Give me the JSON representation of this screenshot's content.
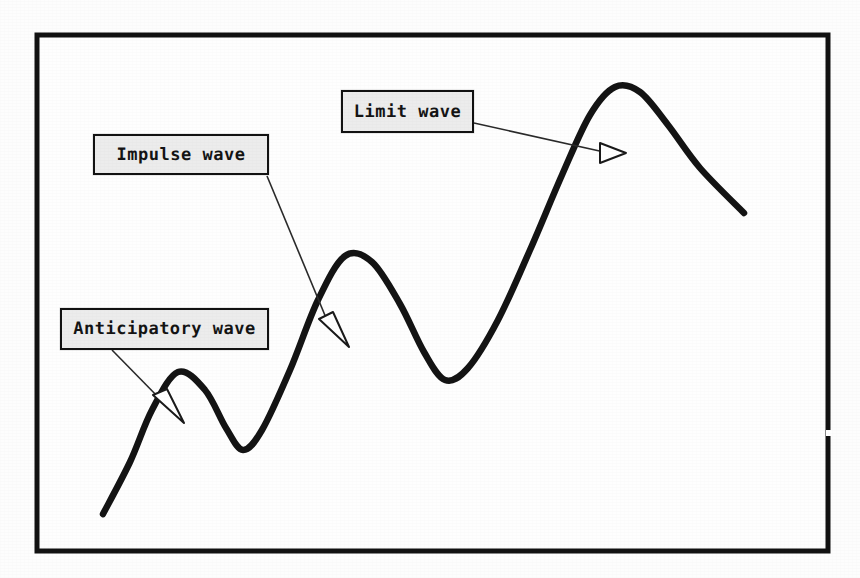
{
  "figure": {
    "background_color": "#fdfdfd",
    "border_color": "#121212",
    "curve_color": "#141414",
    "label_fill_color": "#ececec",
    "label_border_color": "#121212",
    "annotation_line_color": "#2a2a2a"
  },
  "labels": {
    "limit": "Limit wave",
    "impulse": "Impulse wave",
    "anticipatory": "Anticipatory wave"
  },
  "chart_data": {
    "type": "line",
    "title": "",
    "xlabel": "",
    "ylabel": "",
    "grid": false,
    "legend": "none",
    "xlim": [
      103,
      744
    ],
    "ylim": [
      551,
      35
    ],
    "axes_visible": false,
    "series": [
      {
        "name": "wave",
        "description": "Hand-drawn smooth oscillating curve with three rising crests of increasing amplitude",
        "points": [
          [
            103,
            514
          ],
          [
            130,
            462
          ],
          [
            152,
            410
          ],
          [
            178,
            372
          ],
          [
            205,
            390
          ],
          [
            226,
            428
          ],
          [
            243,
            450
          ],
          [
            262,
            430
          ],
          [
            290,
            370
          ],
          [
            318,
            300
          ],
          [
            345,
            256
          ],
          [
            372,
            262
          ],
          [
            400,
            304
          ],
          [
            424,
            352
          ],
          [
            445,
            380
          ],
          [
            468,
            368
          ],
          [
            498,
            320
          ],
          [
            530,
            250
          ],
          [
            562,
            175
          ],
          [
            590,
            115
          ],
          [
            615,
            87
          ],
          [
            640,
            92
          ],
          [
            668,
            125
          ],
          [
            700,
            168
          ],
          [
            744,
            213
          ]
        ]
      }
    ],
    "annotations": [
      {
        "label": "Limit wave",
        "box": {
          "x": 341,
          "y": 90,
          "width": 133,
          "height": 43
        },
        "leader_from": [
          474,
          123
        ],
        "leader_to": [
          604,
          152
        ],
        "arrow_tip": [
          626,
          153
        ],
        "arrow_style": "hollow-triangle",
        "points_to": "third crest (largest rising wave)"
      },
      {
        "label": "Impulse wave",
        "box": {
          "x": 93,
          "y": 134,
          "width": 176,
          "height": 41
        },
        "leader_from": [
          267,
          176
        ],
        "leader_to": [
          326,
          322
        ],
        "arrow_tip": [
          349,
          347
        ],
        "arrow_style": "hollow-triangle",
        "points_to": "second crest (middle wave)"
      },
      {
        "label": "Anticipatory wave",
        "box": {
          "x": 60,
          "y": 308,
          "width": 209,
          "height": 42
        },
        "leader_from": [
          112,
          350
        ],
        "leader_to": [
          159,
          398
        ],
        "arrow_tip": [
          184,
          423
        ],
        "arrow_style": "hollow-triangle",
        "points_to": "first crest (smallest wave)"
      }
    ],
    "frame": {
      "x": 37,
      "y": 35,
      "width": 791,
      "height": 516
    }
  }
}
